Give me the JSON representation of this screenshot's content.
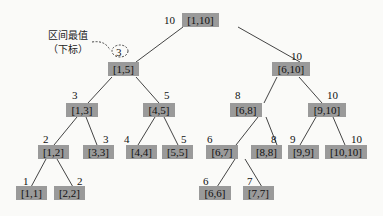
{
  "annotation": {
    "line1": "区间最值",
    "line2": "（下标）"
  },
  "colors": {
    "node_fill": "#9a9a9a",
    "edge": "#444444",
    "background": "#fafaf8"
  },
  "nodes": [
    {
      "id": "n1_10",
      "label": "[1,10]",
      "value": "10"
    },
    {
      "id": "n1_5",
      "label": "[1,5]",
      "value": "3"
    },
    {
      "id": "n6_10",
      "label": "[6,10]",
      "value": "10"
    },
    {
      "id": "n1_3",
      "label": "[1,3]",
      "value": "3"
    },
    {
      "id": "n4_5",
      "label": "[4,5]",
      "value": "5"
    },
    {
      "id": "n6_8",
      "label": "[6,8]",
      "value": "8"
    },
    {
      "id": "n9_10",
      "label": "[9,10]",
      "value": "10"
    },
    {
      "id": "n1_2",
      "label": "[1,2]",
      "value": "2"
    },
    {
      "id": "n3_3",
      "label": "[3,3]",
      "value": "3"
    },
    {
      "id": "n4_4",
      "label": "[4,4]",
      "value": "4"
    },
    {
      "id": "n5_5",
      "label": "[5,5]",
      "value": "5"
    },
    {
      "id": "n6_7",
      "label": "[6,7]",
      "value": "6"
    },
    {
      "id": "n8_8",
      "label": "[8,8]",
      "value": "8"
    },
    {
      "id": "n9_9",
      "label": "[9,9]",
      "value": "9"
    },
    {
      "id": "n10_10",
      "label": "[10,10]",
      "value": "10"
    },
    {
      "id": "n1_1",
      "label": "[1,1]",
      "value": "1"
    },
    {
      "id": "n2_2",
      "label": "[2,2]",
      "value": "2"
    },
    {
      "id": "n6_6",
      "label": "[6,6]",
      "value": "6"
    },
    {
      "id": "n7_7",
      "label": "[7,7]",
      "value": "7"
    }
  ],
  "edges": [
    [
      "[1,10]",
      "[1,5]"
    ],
    [
      "[1,10]",
      "[6,10]"
    ],
    [
      "[1,5]",
      "[1,3]"
    ],
    [
      "[1,5]",
      "[4,5]"
    ],
    [
      "[6,10]",
      "[6,8]"
    ],
    [
      "[6,10]",
      "[9,10]"
    ],
    [
      "[1,3]",
      "[1,2]"
    ],
    [
      "[1,3]",
      "[3,3]"
    ],
    [
      "[4,5]",
      "[4,4]"
    ],
    [
      "[4,5]",
      "[5,5]"
    ],
    [
      "[6,8]",
      "[6,7]"
    ],
    [
      "[6,8]",
      "[8,8]"
    ],
    [
      "[9,10]",
      "[9,9]"
    ],
    [
      "[9,10]",
      "[10,10]"
    ],
    [
      "[1,2]",
      "[1,1]"
    ],
    [
      "[1,2]",
      "[2,2]"
    ],
    [
      "[6,7]",
      "[6,6]"
    ],
    [
      "[6,7]",
      "[7,7]"
    ]
  ]
}
